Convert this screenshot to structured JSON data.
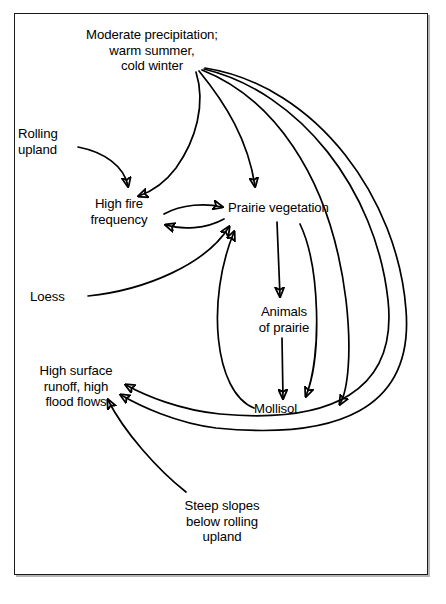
{
  "diagram": {
    "background_color": "#ffffff",
    "line_color": "#000000",
    "border_color": "#1a1a1a",
    "nodes": {
      "climate": "Moderate precipitation;\nwarm summer,\ncold winter",
      "rolling_upland": "Rolling\nupland",
      "high_fire_frequency": "High fire\nfrequency",
      "prairie_vegetation": "Prairie vegetation",
      "loess": "Loess",
      "animals_of_prairie": "Animals\nof prairie",
      "high_surface_runoff": "High surface\nrunoff, high\nflood flows",
      "mollisol": "Mollisol",
      "steep_slopes": "Steep slopes\nbelow rolling\nupland"
    },
    "edges": [
      {
        "from": "climate",
        "to": "high_fire_frequency"
      },
      {
        "from": "climate",
        "to": "prairie_vegetation"
      },
      {
        "from": "climate",
        "to": "mollisol"
      },
      {
        "from": "climate",
        "to": "high_surface_runoff"
      },
      {
        "from": "climate",
        "to": "high_surface_runoff"
      },
      {
        "from": "rolling_upland",
        "to": "high_fire_frequency"
      },
      {
        "from": "high_fire_frequency",
        "to": "prairie_vegetation"
      },
      {
        "from": "prairie_vegetation",
        "to": "high_fire_frequency"
      },
      {
        "from": "loess",
        "to": "prairie_vegetation"
      },
      {
        "from": "prairie_vegetation",
        "to": "animals_of_prairie"
      },
      {
        "from": "animals_of_prairie",
        "to": "mollisol"
      },
      {
        "from": "prairie_vegetation",
        "to": "mollisol"
      },
      {
        "from": "mollisol",
        "to": "prairie_vegetation"
      },
      {
        "from": "steep_slopes",
        "to": "high_surface_runoff"
      }
    ]
  }
}
